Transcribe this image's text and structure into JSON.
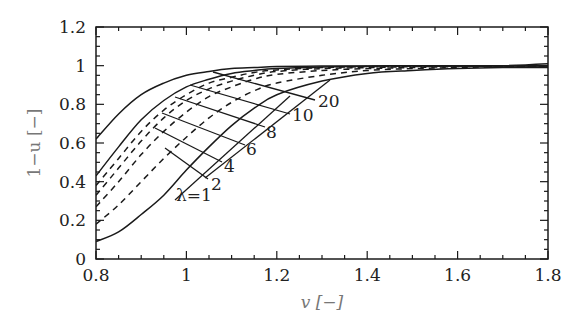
{
  "chart_data": {
    "type": "line",
    "title": "",
    "xlabel": "v [−]",
    "ylabel": "1−u [−]",
    "xlim": [
      0.8,
      1.8
    ],
    "ylim": [
      0,
      1.2
    ],
    "xticks": [
      0.8,
      1.0,
      1.2,
      1.4,
      1.6,
      1.8
    ],
    "xtick_labels": [
      "0.8",
      "1",
      "1.2",
      "1.4",
      "1.6",
      "1.8"
    ],
    "yticks": [
      0,
      0.2,
      0.4,
      0.6,
      0.8,
      1.0,
      1.2
    ],
    "ytick_labels": [
      "0",
      "0.2",
      "0.4",
      "0.6",
      "0.8",
      "1",
      "1.2"
    ],
    "grid": false,
    "legend": "inline labels with leader lines",
    "x": [
      0.8,
      0.85,
      0.9,
      0.95,
      1.0,
      1.05,
      1.1,
      1.15,
      1.2,
      1.3,
      1.4,
      1.5,
      1.6,
      1.7,
      1.8
    ],
    "series": [
      {
        "name": "λ=1",
        "style": "solid",
        "values": [
          0.09,
          0.14,
          0.23,
          0.33,
          0.46,
          0.58,
          0.69,
          0.78,
          0.85,
          0.92,
          0.96,
          0.975,
          0.985,
          0.99,
          0.99
        ]
      },
      {
        "name": "λ=2",
        "style": "dashed",
        "values": [
          0.18,
          0.28,
          0.4,
          0.52,
          0.63,
          0.73,
          0.81,
          0.87,
          0.91,
          0.95,
          0.975,
          0.985,
          0.99,
          0.995,
          0.995
        ]
      },
      {
        "name": "λ=4",
        "style": "dashed",
        "values": [
          0.27,
          0.4,
          0.54,
          0.66,
          0.76,
          0.84,
          0.89,
          0.93,
          0.955,
          0.975,
          0.985,
          0.99,
          0.995,
          0.997,
          0.998
        ]
      },
      {
        "name": "λ=6",
        "style": "dashed",
        "values": [
          0.33,
          0.47,
          0.61,
          0.73,
          0.82,
          0.88,
          0.92,
          0.95,
          0.97,
          0.985,
          0.99,
          0.995,
          0.997,
          0.998,
          0.999
        ]
      },
      {
        "name": "λ=8",
        "style": "dashed",
        "values": [
          0.38,
          0.52,
          0.66,
          0.77,
          0.85,
          0.91,
          0.94,
          0.965,
          0.978,
          0.99,
          0.995,
          0.997,
          0.998,
          0.999,
          1.0
        ]
      },
      {
        "name": "λ=10",
        "style": "solid",
        "values": [
          0.43,
          0.58,
          0.72,
          0.82,
          0.89,
          0.93,
          0.96,
          0.975,
          0.985,
          0.993,
          0.997,
          0.998,
          0.999,
          1.0,
          1.0
        ]
      },
      {
        "name": "λ=20",
        "style": "solid",
        "values": [
          0.62,
          0.75,
          0.85,
          0.91,
          0.95,
          0.97,
          0.985,
          0.99,
          0.995,
          0.998,
          0.999,
          1.0,
          1.0,
          1.0,
          1.01
        ]
      }
    ],
    "annotations": [
      {
        "text": "20",
        "x": 1.29,
        "y": 0.82
      },
      {
        "text": "10",
        "x": 1.23,
        "y": 0.75
      },
      {
        "text": "8",
        "x": 1.17,
        "y": 0.66
      },
      {
        "text": "6",
        "x": 1.13,
        "y": 0.57
      },
      {
        "text": "4",
        "x": 1.08,
        "y": 0.48
      },
      {
        "text": "2",
        "x": 1.05,
        "y": 0.39
      },
      {
        "text": "λ=1",
        "x": 0.98,
        "y": 0.33
      }
    ]
  },
  "labels": {
    "x_axis": "v [−]",
    "y_axis": "1−u [−]"
  }
}
